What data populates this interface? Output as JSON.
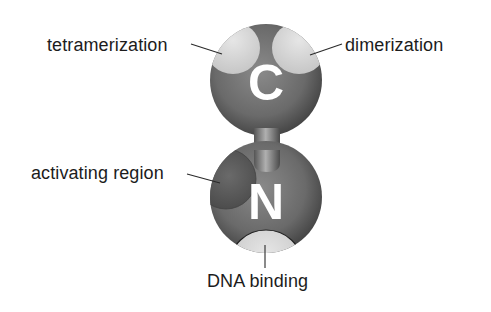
{
  "diagram": {
    "title": "",
    "domains": [
      {
        "id": "c-terminal",
        "letter": "C"
      },
      {
        "id": "n-terminal",
        "letter": "N"
      }
    ],
    "labels": {
      "tetramerization": "tetramerization",
      "dimerization": "dimerization",
      "activating_region": "activating region",
      "dna_binding": "DNA binding"
    },
    "colors": {
      "sphere": "#6e6e6e",
      "sphere_highlight": "#9a9a9a",
      "sphere_shadow": "#3e3e3e",
      "patch_light": "#d6d6d6",
      "patch_dark": "#555555",
      "text": "#1c1c1c",
      "letter": "#ffffff"
    }
  }
}
